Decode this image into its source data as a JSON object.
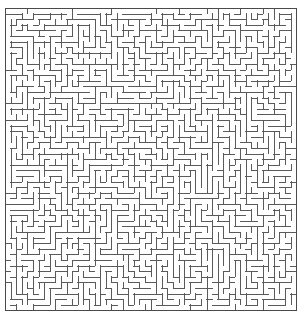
{
  "figure": {
    "type": "maze",
    "title": ""
  },
  "canvas": {
    "width": 306,
    "height": 321,
    "background_color": "#ffffff"
  },
  "maze": {
    "grid": {
      "columns": 52,
      "rows": 54,
      "cell_size": 5.6
    },
    "origin": {
      "x": 5,
      "y": 8
    },
    "extent": {
      "left": 5,
      "top": 8,
      "right": 296.2,
      "bottom": 310.4,
      "width": 291.2,
      "height": 302.4
    },
    "style": {
      "wall_color": "#5a5a5a",
      "border_color": "#4a4a4a",
      "wall_thickness": 1,
      "border_thickness": 1.1,
      "passage_color": "#ffffff"
    },
    "openings": {
      "top_border": "closed",
      "bottom_border": "closed",
      "left_border": "closed",
      "right_border": "closed"
    },
    "generation": {
      "algorithm": "recursive-backtracker",
      "seed": 20240617,
      "perfect": true
    }
  }
}
